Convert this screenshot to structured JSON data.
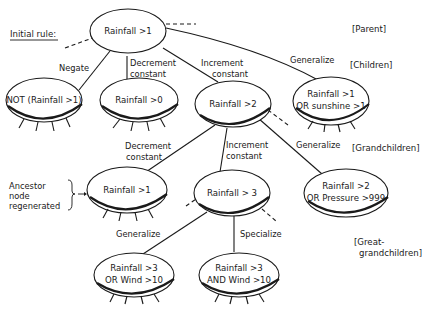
{
  "diagram": {
    "title_label": "Initial rule:",
    "level_labels": {
      "parent": "[Parent]",
      "children": "[Children]",
      "grandchildren": "[Grandchildren]",
      "great_grandchildren_line1": "[Great-",
      "great_grandchildren_line2": "grandchildren]"
    },
    "side_note": {
      "line1": "Ancestor",
      "line2": "node",
      "line3": "regenerated"
    },
    "nodes": {
      "root": {
        "line1": "Rainfall  >1"
      },
      "child_negate": {
        "line1": "NOT (Rainfall >1)"
      },
      "child_decrement": {
        "line1": "Rainfall >0"
      },
      "child_increment": {
        "line1": "Rainfall >2"
      },
      "child_generalize": {
        "line1": "Rainfall >1",
        "line2": "OR  sunshine >1"
      },
      "gc_decrement": {
        "line1": "Rainfall >1"
      },
      "gc_increment": {
        "line1": "Rainfall   > 3"
      },
      "gc_generalize": {
        "line1": "Rainfall >2",
        "line2": "OR Pressure >999"
      },
      "ggc_generalize": {
        "line1": "Rainfall >3",
        "line2": "OR Wind >10"
      },
      "ggc_specialize": {
        "line1": "Rainfall >3",
        "line2": "AND Wind >10"
      }
    },
    "edges": {
      "negate": "Negate",
      "decrement_1": "Decrement",
      "decrement_2": "constant",
      "increment_1": "Increment",
      "increment_2": "constant",
      "generalize": "Generalize",
      "gc_decrement_1": "Decrement",
      "gc_decrement_2": "constant",
      "gc_increment_1": "Increment",
      "gc_increment_2": "constant",
      "gc_generalize": "Generalize",
      "ggc_generalize": "Generalize",
      "ggc_specialize": "Specialize"
    }
  }
}
